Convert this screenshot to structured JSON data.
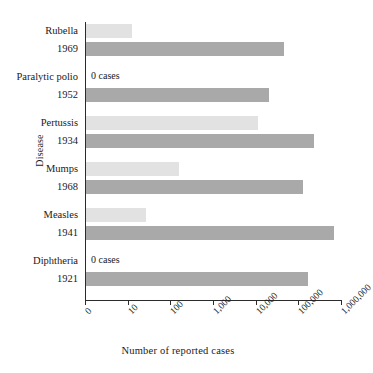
{
  "chart_data": {
    "type": "bar",
    "orientation": "horizontal",
    "title": "",
    "xlabel": "Number of reported cases",
    "ylabel": "Disease",
    "xscale": "log",
    "grid": false,
    "legend": null,
    "xticks": [
      "0",
      "10",
      "100",
      "1,000",
      "10,000",
      "100,000",
      "1,000,000"
    ],
    "xtick_values": [
      0,
      10,
      100,
      1000,
      10000,
      100000,
      1000000
    ],
    "categories": [
      "Rubella",
      "Paralytic polio",
      "Pertussis",
      "Mumps",
      "Measles",
      "Diphtheria"
    ],
    "series": [
      {
        "name": "Current",
        "color": "#e2e2e2",
        "values": [
          12,
          0,
          11000,
          150,
          25,
          0
        ],
        "labels": [
          "",
          "0 cases",
          "",
          "",
          "",
          "0 cases"
        ]
      },
      {
        "name": "Peak year",
        "color": "#a9a9a9",
        "values": [
          44000,
          19000,
          220000,
          120000,
          650000,
          160000
        ],
        "labels": [
          "1969",
          "1952",
          "1934",
          "1968",
          "1941",
          "1921"
        ]
      }
    ],
    "groups": [
      {
        "disease": "Rubella",
        "peak_year": "1969",
        "current_value": 12,
        "current_note": "",
        "peak_value": 44000
      },
      {
        "disease": "Paralytic polio",
        "peak_year": "1952",
        "current_value": 0,
        "current_note": "0 cases",
        "peak_value": 19000
      },
      {
        "disease": "Pertussis",
        "peak_year": "1934",
        "current_value": 11000,
        "current_note": "",
        "peak_value": 220000
      },
      {
        "disease": "Mumps",
        "peak_year": "1968",
        "current_value": 150,
        "current_note": "",
        "peak_value": 120000
      },
      {
        "disease": "Measles",
        "peak_year": "1941",
        "current_value": 25,
        "current_note": "",
        "peak_value": 650000
      },
      {
        "disease": "Diphtheria",
        "peak_year": "1921",
        "current_value": 0,
        "current_note": "0 cases",
        "peak_value": 160000
      }
    ]
  }
}
